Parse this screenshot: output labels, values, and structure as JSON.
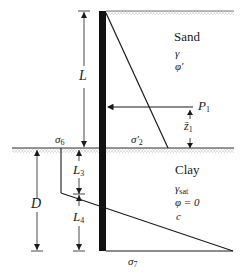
{
  "diagram": {
    "type": "cantilever sheet pile in sand over clay - net pressure distribution",
    "layers": {
      "sand": {
        "name": "Sand",
        "props": [
          "γ",
          "φ′"
        ]
      },
      "clay": {
        "name": "Clay",
        "props": [
          "γsat",
          "φ = 0",
          "c"
        ],
        "gamma": "γ",
        "gamma_sub": "sat",
        "phi": "φ = 0",
        "cohesion": "c"
      }
    },
    "dimensions": {
      "L": "L",
      "D": "D",
      "L3": {
        "main": "L",
        "sub": "3"
      },
      "L4": {
        "main": "L",
        "sub": "4"
      },
      "z1": {
        "main": "z̄",
        "sub": "1"
      }
    },
    "force": {
      "main": "P",
      "sub": "1"
    },
    "stresses": {
      "sigma2": {
        "main": "σ′",
        "sub": "2"
      },
      "sigma6": {
        "main": "σ",
        "sub": "6"
      },
      "sigma7": {
        "main": "σ",
        "sub": "7"
      }
    },
    "colors": {
      "line": "#1a1a1a",
      "wall": "#111111",
      "ground": "#9a9a9a"
    }
  }
}
